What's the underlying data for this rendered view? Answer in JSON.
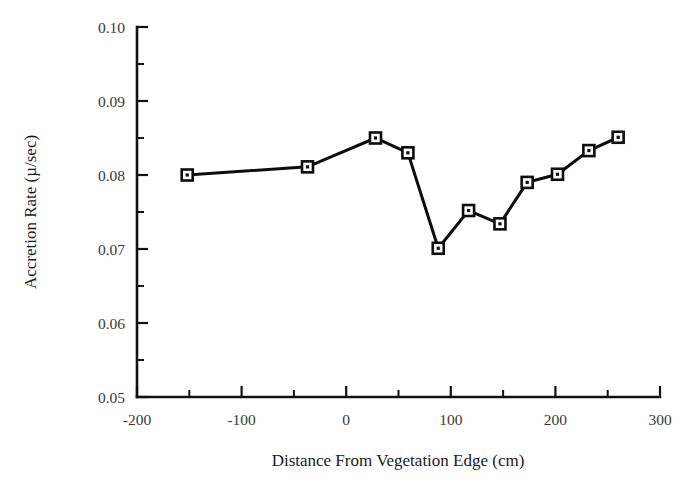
{
  "chart_data": {
    "type": "line",
    "title": "",
    "subtitle": "",
    "xlabel": "Distance From Vegetation Edge (cm)",
    "ylabel": "Accretion Rate (µ/sec)",
    "xlim": [
      -200,
      300
    ],
    "ylim": [
      0.05,
      0.1
    ],
    "grid": false,
    "legend": null,
    "legend_position": "none",
    "x_major_ticks": [
      -200,
      -100,
      0,
      100,
      200,
      300
    ],
    "x_tick_labels": [
      "-200",
      "-100",
      "0",
      "100",
      "200",
      "300"
    ],
    "x_minor_ticks": [
      -150,
      -50,
      50,
      150,
      250
    ],
    "y_major_ticks": [
      0.05,
      0.06,
      0.07,
      0.08,
      0.09,
      0.1
    ],
    "y_tick_labels": [
      "0.05",
      "0.06",
      "0.07",
      "0.08",
      "0.09",
      "0.10"
    ],
    "y_minor_ticks": [
      0.055,
      0.065,
      0.075,
      0.085,
      0.095
    ],
    "marker": "open-square-with-center-dot",
    "line_color": "#0d0d0d",
    "marker_fill": "#ffffff",
    "marker_edge": "#0d0d0d",
    "series": [
      {
        "name": "Accretion Rate",
        "x": [
          -152,
          -37,
          28,
          59,
          88,
          117,
          147,
          173,
          202,
          232,
          260
        ],
        "values": [
          0.08,
          0.0811,
          0.085,
          0.083,
          0.0701,
          0.0752,
          0.0734,
          0.079,
          0.0801,
          0.0833,
          0.0851
        ]
      }
    ],
    "points": [
      {
        "x": -152,
        "y": 0.08
      },
      {
        "x": -37,
        "y": 0.0811
      },
      {
        "x": 28,
        "y": 0.085
      },
      {
        "x": 59,
        "y": 0.083
      },
      {
        "x": 88,
        "y": 0.0701
      },
      {
        "x": 117,
        "y": 0.0752
      },
      {
        "x": 147,
        "y": 0.0734
      },
      {
        "x": 173,
        "y": 0.079
      },
      {
        "x": 202,
        "y": 0.0801
      },
      {
        "x": 232,
        "y": 0.0833
      },
      {
        "x": 260,
        "y": 0.0851
      }
    ]
  },
  "axes": {
    "x_axis_name": "x-axis",
    "y_axis_name": "y-axis"
  }
}
